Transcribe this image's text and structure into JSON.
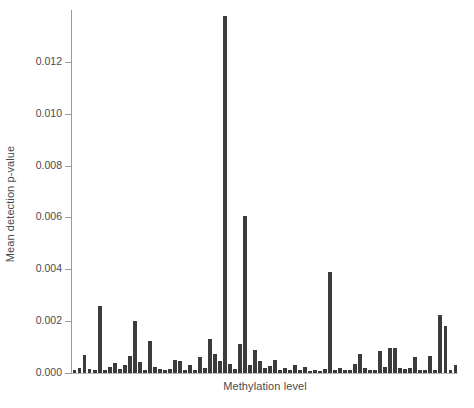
{
  "chart_data": {
    "type": "bar",
    "title": "",
    "xlabel": "Methylation level",
    "ylabel": "Mean detection p-value",
    "ylim": [
      0.0,
      0.014
    ],
    "xlim": [
      0,
      77
    ],
    "grid": false,
    "legend": null,
    "bar_color": "#3b3b3b",
    "axis_color": "#9a9a9a",
    "text_color": "#4a4a4a",
    "background": "#ffffff",
    "ytick_labels": [
      "0.000",
      "0.002",
      "0.004",
      "0.006",
      "0.008",
      "0.010",
      "0.012"
    ],
    "ytick_values": [
      0.0,
      0.002,
      0.004,
      0.006,
      0.008,
      0.01,
      0.012
    ],
    "xtick_labels": [],
    "categories": [
      "1",
      "2",
      "3",
      "4",
      "5",
      "6",
      "7",
      "8",
      "9",
      "10",
      "11",
      "12",
      "13",
      "14",
      "15",
      "16",
      "17",
      "18",
      "19",
      "20",
      "21",
      "22",
      "23",
      "24",
      "25",
      "26",
      "27",
      "28",
      "29",
      "30",
      "31",
      "32",
      "33",
      "34",
      "35",
      "36",
      "37",
      "38",
      "39",
      "40",
      "41",
      "42",
      "43",
      "44",
      "45",
      "46",
      "47",
      "48",
      "49",
      "50",
      "51",
      "52",
      "53",
      "54",
      "55",
      "56",
      "57",
      "58",
      "59",
      "60",
      "61",
      "62",
      "63",
      "64",
      "65",
      "66",
      "67",
      "68",
      "69",
      "70",
      "71",
      "72",
      "73",
      "74",
      "75",
      "76",
      "77"
    ],
    "values": [
      0.00012,
      0.00018,
      0.0007,
      0.00015,
      0.0001,
      0.0026,
      0.00012,
      0.00022,
      0.0004,
      0.00016,
      0.0003,
      0.00065,
      0.002,
      0.00042,
      0.00012,
      0.00125,
      0.00024,
      0.00014,
      0.00011,
      0.00016,
      0.0005,
      0.00048,
      0.00013,
      0.0003,
      0.00012,
      0.0006,
      0.0002,
      0.0013,
      0.00075,
      0.00045,
      0.01375,
      0.00035,
      0.00015,
      0.0011,
      0.00605,
      0.0003,
      0.0009,
      0.00046,
      0.00018,
      0.00028,
      0.0005,
      0.0001,
      0.0002,
      0.00012,
      0.0003,
      0.0001,
      0.00022,
      9e-05,
      0.00011,
      7e-05,
      0.00014,
      0.0039,
      0.00013,
      0.0002,
      0.0001,
      0.00012,
      0.00036,
      0.00074,
      0.00018,
      0.0001,
      0.00012,
      0.00085,
      0.00022,
      0.00095,
      0.00095,
      0.0002,
      0.00014,
      0.00018,
      0.0006,
      0.00012,
      0.00012,
      0.00065,
      0.0001,
      0.00225,
      0.0018,
      0.00012,
      0.0003
    ]
  }
}
